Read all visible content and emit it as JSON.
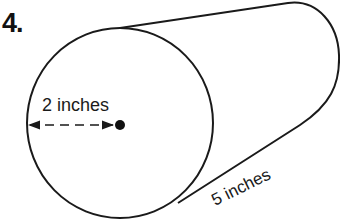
{
  "problem": {
    "number_label": "4."
  },
  "figure": {
    "type": "cylinder",
    "radius_label": "2 inches",
    "length_label": "5 inches",
    "stroke_color": "#1a1a1a",
    "background": "#ffffff"
  }
}
